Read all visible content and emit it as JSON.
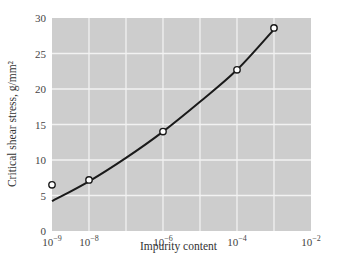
{
  "chart_data": {
    "type": "line",
    "title": "",
    "xlabel": "Impurity content",
    "ylabel": "Critical shear stress, g/mm²",
    "xscale": "log",
    "xlim": [
      1e-09,
      0.01
    ],
    "ylim": [
      0,
      30
    ],
    "grid": true,
    "legend": null,
    "x_ticks": [
      {
        "base": "10",
        "exp": "−9",
        "value": 1e-09
      },
      {
        "base": "10",
        "exp": "−8",
        "value": 1e-08
      },
      {
        "base": "10",
        "exp": "−6",
        "value": 1e-06
      },
      {
        "base": "10",
        "exp": "−4",
        "value": 0.0001
      },
      {
        "base": "10",
        "exp": "−2",
        "value": 0.01
      }
    ],
    "y_ticks": [
      "0",
      "5",
      "10",
      "15",
      "20",
      "25",
      "30"
    ],
    "series": [
      {
        "name": "measured",
        "marker": "open-circle",
        "points": [
          {
            "x": 1e-09,
            "y": 6.5
          },
          {
            "x": 1e-08,
            "y": 7.2
          },
          {
            "x": 1e-06,
            "y": 14.0
          },
          {
            "x": 0.0001,
            "y": 22.7
          },
          {
            "x": 0.001,
            "y": 28.6
          }
        ]
      },
      {
        "name": "fitted-curve",
        "marker": "none",
        "points": [
          {
            "x": 1e-09,
            "y": 4.2
          },
          {
            "x": 1e-08,
            "y": 7.0
          },
          {
            "x": 1e-07,
            "y": 10.3
          },
          {
            "x": 1e-06,
            "y": 14.0
          },
          {
            "x": 1e-05,
            "y": 18.2
          },
          {
            "x": 0.0001,
            "y": 22.7
          },
          {
            "x": 0.001,
            "y": 28.4
          }
        ]
      }
    ]
  },
  "colors": {
    "plot_bg": "#cdcdcd",
    "grid": "#f2f2f2",
    "line": "#1a1a1a",
    "marker_fill": "#ffffff"
  }
}
